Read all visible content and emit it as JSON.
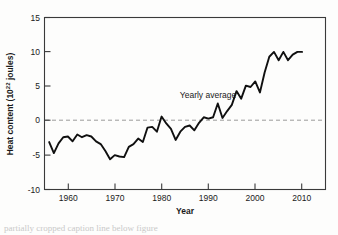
{
  "figure": {
    "background_color": "#fdfdfc",
    "line_color": "#101010",
    "zero_line_color": "#9a9a9a",
    "axis_color": "#3a3a3a"
  },
  "chart_data": {
    "type": "line",
    "title": "",
    "xlabel": "Year",
    "ylabel_prefix": "Heat content (10",
    "ylabel_sup": "22",
    "ylabel_suffix": " joules)",
    "ylabel_full": "Heat content (10^22 joules)",
    "xlim": [
      1955,
      2015
    ],
    "ylim": [
      -10,
      15
    ],
    "xticks": [
      1960,
      1970,
      1980,
      1990,
      2000,
      2010
    ],
    "xtick_labels": [
      "1960",
      "1970",
      "1980",
      "1990",
      "2000",
      "2010"
    ],
    "yticks": [
      -10,
      -5,
      0,
      5,
      10,
      15
    ],
    "ytick_labels": [
      "-10",
      "-5",
      "0",
      "5",
      "10",
      "15"
    ],
    "grid": false,
    "legend_position": "none",
    "annotations": [
      {
        "text": "Yearly average",
        "x": 1991,
        "y": 3.2
      }
    ],
    "reference_lines": [
      {
        "axis": "y",
        "value": 0,
        "style": "dashed",
        "color": "#9a9a9a"
      }
    ],
    "series": [
      {
        "name": "Yearly average",
        "x": [
          1956,
          1957,
          1958,
          1959,
          1960,
          1961,
          1962,
          1963,
          1964,
          1965,
          1966,
          1967,
          1968,
          1969,
          1970,
          1971,
          1972,
          1973,
          1974,
          1975,
          1976,
          1977,
          1978,
          1979,
          1980,
          1981,
          1982,
          1983,
          1984,
          1985,
          1986,
          1987,
          1988,
          1989,
          1990,
          1991,
          1992,
          1993,
          1994,
          1995,
          1996,
          1997,
          1998,
          1999,
          2000,
          2001,
          2002,
          2003,
          2004,
          2005,
          2006,
          2007,
          2008,
          2009,
          2010
        ],
        "values": [
          -3.1,
          -4.7,
          -3.3,
          -2.4,
          -2.3,
          -3.0,
          -2.0,
          -2.4,
          -2.1,
          -2.3,
          -3.0,
          -3.4,
          -4.4,
          -5.6,
          -5.0,
          -5.2,
          -5.3,
          -3.8,
          -3.4,
          -2.6,
          -3.1,
          -1.0,
          -0.9,
          -1.6,
          0.6,
          -0.4,
          -1.2,
          -2.8,
          -1.6,
          -0.9,
          -0.7,
          -1.4,
          -0.3,
          0.5,
          0.3,
          0.5,
          2.5,
          0.4,
          1.4,
          2.3,
          4.3,
          3.2,
          5.1,
          4.9,
          5.7,
          4.1,
          7.0,
          9.3,
          10.0,
          8.8,
          10.0,
          8.8,
          9.6,
          10.0,
          10.0
        ]
      }
    ]
  },
  "caption": {
    "text": "partially cropped caption line below figure"
  }
}
